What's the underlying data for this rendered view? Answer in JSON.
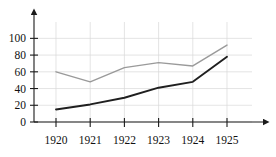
{
  "chart_data": {
    "type": "line",
    "title": "",
    "subtitle": "",
    "xlabel": "",
    "ylabel": "",
    "categories": [
      "1920",
      "1921",
      "1922",
      "1923",
      "1924",
      "1925"
    ],
    "x": [
      1920,
      1921,
      1922,
      1923,
      1924,
      1925
    ],
    "series": [
      {
        "name": "upper-series",
        "color": "#9a9a9a",
        "values": [
          60,
          48,
          65,
          71,
          67,
          92
        ]
      },
      {
        "name": "lower-series",
        "color": "#1f1f1f",
        "values": [
          15,
          21,
          29,
          41,
          48,
          78
        ]
      }
    ],
    "ylim": [
      0,
      110
    ],
    "xlim": [
      1919.45,
      1925.9
    ],
    "yticks": [
      0,
      20,
      40,
      60,
      80,
      100
    ],
    "ytick_labels": [
      "0",
      "20",
      "40",
      "60",
      "80",
      "100"
    ],
    "xtick_labels": [
      "1920",
      "1921",
      "1922",
      "1923",
      "1924",
      "1925"
    ],
    "grid": true,
    "grid_color": "#d8d8d8",
    "legend": false,
    "legend_position": "none",
    "axis_color": "#1a1a1a",
    "axis_arrows": true,
    "annotations": []
  }
}
